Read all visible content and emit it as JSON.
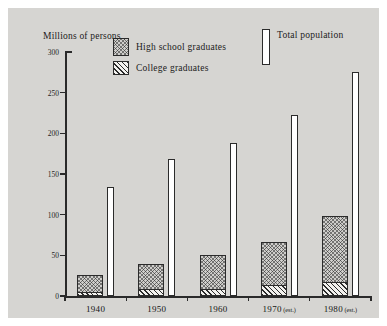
{
  "chart_data": {
    "type": "bar",
    "title": "",
    "subtitle": "",
    "ylabel": "Millions of persons",
    "xlabel": "",
    "ylim": [
      0,
      300
    ],
    "yticks": [
      0,
      50,
      100,
      150,
      200,
      250,
      300
    ],
    "ytick_labels": [
      "0",
      "50",
      "100",
      "150",
      "200",
      "250",
      "300"
    ],
    "grid": false,
    "legend_position": "top-inside",
    "categories": [
      "1940",
      "1950",
      "1960",
      "1970",
      "1980"
    ],
    "category_labels": [
      {
        "year": "1940",
        "note": ""
      },
      {
        "year": "1950",
        "note": ""
      },
      {
        "year": "1960",
        "note": ""
      },
      {
        "year": "1970",
        "note": "(est.)"
      },
      {
        "year": "1980",
        "note": "(est.)"
      }
    ],
    "series": [
      {
        "name": "High school graduates",
        "key": "hs",
        "values": [
          26,
          39,
          51,
          67,
          98
        ],
        "pattern": "cross-hatch"
      },
      {
        "name": "College graduates",
        "key": "college",
        "values": [
          5,
          8,
          9,
          13,
          17
        ],
        "pattern": "diagonal-hatch"
      },
      {
        "name": "Total population",
        "key": "population",
        "values": [
          134,
          168,
          188,
          222,
          276
        ],
        "pattern": "open-outline"
      }
    ]
  },
  "legend": {
    "items": [
      {
        "label": "High school graduates",
        "swatch": "cross-hatch-swatch"
      },
      {
        "label": "College graduates",
        "swatch": "diagonal-hatch-swatch"
      },
      {
        "label": "Total population",
        "swatch": "open-outline-swatch"
      }
    ]
  },
  "colors": {
    "plate_background": "#d6d5d2",
    "page_background": "#ffffff",
    "axis": "#2a2a2a",
    "ink": "#1b1b1b",
    "bar_open": "#ffffff"
  }
}
